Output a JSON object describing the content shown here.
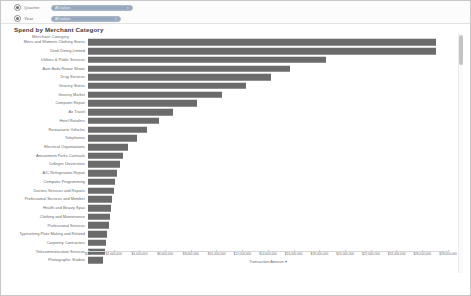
{
  "filters": {
    "rows": [
      {
        "label": "Quarter",
        "value": "All values",
        "caret": "▾"
      },
      {
        "label": "Year",
        "value": "All values",
        "caret": "▾"
      }
    ]
  },
  "chart_title": "Spend by Merchant Category",
  "y_axis_title": "Merchant Category",
  "x_axis_title": "Transaction Amount",
  "x_axis_sort_glyph": "▾",
  "scrollbar": {
    "present": true
  },
  "chart_data": {
    "type": "bar",
    "orientation": "horizontal",
    "title": "Spend by Merchant Category",
    "xlabel": "Transaction Amount",
    "ylabel": "Merchant Category",
    "grid": false,
    "legend": "none",
    "xlim": [
      0,
      56000
    ],
    "tick_labels": [
      "$0.0",
      "$2,000,000",
      "$4,000,000",
      "$6,000,000",
      "$8,000,000",
      "$10,000,000",
      "$12,000,000",
      "$14,000,000",
      "$16,000,000",
      "$18,000,000",
      "$20,000,000",
      "$22,000,000",
      "$24,000,000",
      "$26,000,000",
      "$28,000,000"
    ],
    "tick_values": [
      0,
      4000,
      8000,
      12000,
      16000,
      20000,
      24000,
      28000,
      32000,
      36000,
      40000,
      44000,
      48000,
      52000,
      56000
    ],
    "categories": [
      "Mens and Womens Clothing Stores",
      "Drink Dining Limited",
      "Utilities & Public Services",
      "Auto Body Repair Shops",
      "Drug Services",
      "Grocery Stores",
      "Grocery Market",
      "Computer Repair",
      "Air Travel",
      "Hotel Retailers",
      "Restaurants Vehicles",
      "Telephones",
      "Electrical Organizations",
      "Amusement Parks Carnivals",
      "Colleges Universities",
      "A/C Refrigeration Repair",
      "Computer Programming",
      "Doctors Services and Repairs",
      "Professional Services and Member",
      "Health and Beauty Spas",
      "Clothing and Maintenance",
      "Professional Services",
      "Typesetting Plate Making and Related",
      "Carpentry Contractors",
      "Telecommunication Services",
      "Photographic Studios"
    ],
    "values": [
      54200,
      54200,
      37000,
      31400,
      28400,
      24600,
      20800,
      17000,
      13200,
      11000,
      9200,
      7600,
      6200,
      5400,
      4900,
      4500,
      4200,
      4000,
      3800,
      3600,
      3400,
      3200,
      3000,
      2800,
      2600,
      2400
    ]
  }
}
